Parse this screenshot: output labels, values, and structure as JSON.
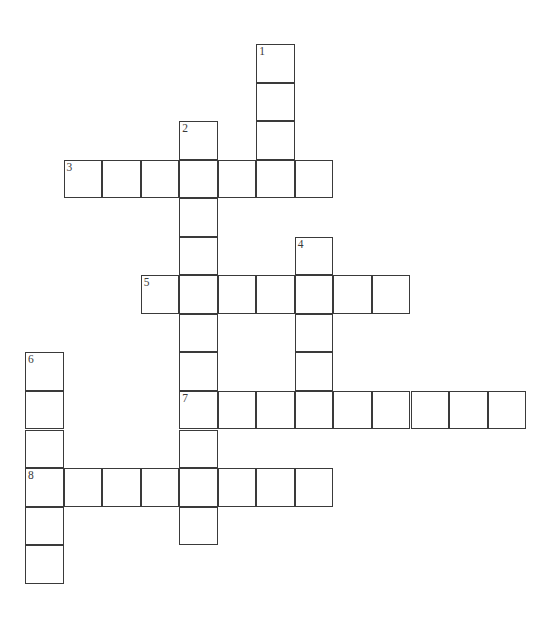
{
  "puzzle": {
    "title": "Crossword Puzzle Grid",
    "geometry": {
      "cell_size": 38.55,
      "origin_x": 25,
      "origin_y": 44,
      "columns": 14,
      "rows": 15
    },
    "entries": [
      {
        "number": "1",
        "direction": "down",
        "col": 6,
        "row": 0,
        "length": 4
      },
      {
        "number": "2",
        "direction": "down",
        "col": 4,
        "row": 2,
        "length": 11
      },
      {
        "number": "3",
        "direction": "across",
        "col": 1,
        "row": 3,
        "length": 7
      },
      {
        "number": "4",
        "direction": "down",
        "col": 7,
        "row": 5,
        "length": 4
      },
      {
        "number": "5",
        "direction": "across",
        "col": 3,
        "row": 6,
        "length": 7
      },
      {
        "number": "6",
        "direction": "down",
        "col": 0,
        "row": 8,
        "length": 6
      },
      {
        "number": "7",
        "direction": "across",
        "col": 4,
        "row": 9,
        "length": 9
      },
      {
        "number": "8",
        "direction": "across",
        "col": 0,
        "row": 11,
        "length": 8
      }
    ],
    "cells": [
      {
        "col": 6,
        "row": 0,
        "number": "1",
        "letter": ""
      },
      {
        "col": 6,
        "row": 1,
        "number": "",
        "letter": ""
      },
      {
        "col": 6,
        "row": 2,
        "number": "",
        "letter": ""
      },
      {
        "col": 6,
        "row": 3,
        "number": "",
        "letter": ""
      },
      {
        "col": 4,
        "row": 2,
        "number": "2",
        "letter": ""
      },
      {
        "col": 4,
        "row": 3,
        "number": "",
        "letter": ""
      },
      {
        "col": 4,
        "row": 4,
        "number": "",
        "letter": ""
      },
      {
        "col": 4,
        "row": 5,
        "number": "",
        "letter": ""
      },
      {
        "col": 4,
        "row": 6,
        "number": "",
        "letter": ""
      },
      {
        "col": 4,
        "row": 7,
        "number": "",
        "letter": ""
      },
      {
        "col": 4,
        "row": 8,
        "number": "",
        "letter": ""
      },
      {
        "col": 4,
        "row": 9,
        "number": "7",
        "letter": ""
      },
      {
        "col": 4,
        "row": 10,
        "number": "",
        "letter": ""
      },
      {
        "col": 4,
        "row": 11,
        "number": "",
        "letter": ""
      },
      {
        "col": 4,
        "row": 12,
        "number": "",
        "letter": ""
      },
      {
        "col": 1,
        "row": 3,
        "number": "3",
        "letter": ""
      },
      {
        "col": 2,
        "row": 3,
        "number": "",
        "letter": ""
      },
      {
        "col": 3,
        "row": 3,
        "number": "",
        "letter": ""
      },
      {
        "col": 5,
        "row": 3,
        "number": "",
        "letter": ""
      },
      {
        "col": 7,
        "row": 3,
        "number": "",
        "letter": ""
      },
      {
        "col": 7,
        "row": 5,
        "number": "4",
        "letter": ""
      },
      {
        "col": 7,
        "row": 6,
        "number": "",
        "letter": ""
      },
      {
        "col": 7,
        "row": 7,
        "number": "",
        "letter": ""
      },
      {
        "col": 7,
        "row": 8,
        "number": "",
        "letter": ""
      },
      {
        "col": 7,
        "row": 9,
        "number": "",
        "letter": ""
      },
      {
        "col": 3,
        "row": 6,
        "number": "5",
        "letter": ""
      },
      {
        "col": 5,
        "row": 6,
        "number": "",
        "letter": ""
      },
      {
        "col": 6,
        "row": 6,
        "number": "",
        "letter": ""
      },
      {
        "col": 8,
        "row": 6,
        "number": "",
        "letter": ""
      },
      {
        "col": 9,
        "row": 6,
        "number": "",
        "letter": ""
      },
      {
        "col": 0,
        "row": 8,
        "number": "6",
        "letter": ""
      },
      {
        "col": 0,
        "row": 9,
        "number": "",
        "letter": ""
      },
      {
        "col": 0,
        "row": 10,
        "number": "",
        "letter": ""
      },
      {
        "col": 0,
        "row": 11,
        "number": "8",
        "letter": ""
      },
      {
        "col": 0,
        "row": 12,
        "number": "",
        "letter": ""
      },
      {
        "col": 0,
        "row": 13,
        "number": "",
        "letter": ""
      },
      {
        "col": 5,
        "row": 9,
        "number": "",
        "letter": ""
      },
      {
        "col": 6,
        "row": 9,
        "number": "",
        "letter": ""
      },
      {
        "col": 8,
        "row": 9,
        "number": "",
        "letter": ""
      },
      {
        "col": 9,
        "row": 9,
        "number": "",
        "letter": ""
      },
      {
        "col": 10,
        "row": 9,
        "number": "",
        "letter": ""
      },
      {
        "col": 11,
        "row": 9,
        "number": "",
        "letter": ""
      },
      {
        "col": 12,
        "row": 9,
        "number": "",
        "letter": ""
      },
      {
        "col": 1,
        "row": 11,
        "number": "",
        "letter": ""
      },
      {
        "col": 2,
        "row": 11,
        "number": "",
        "letter": ""
      },
      {
        "col": 3,
        "row": 11,
        "number": "",
        "letter": ""
      },
      {
        "col": 5,
        "row": 11,
        "number": "",
        "letter": ""
      },
      {
        "col": 6,
        "row": 11,
        "number": "",
        "letter": ""
      },
      {
        "col": 7,
        "row": 11,
        "number": "",
        "letter": ""
      }
    ]
  }
}
